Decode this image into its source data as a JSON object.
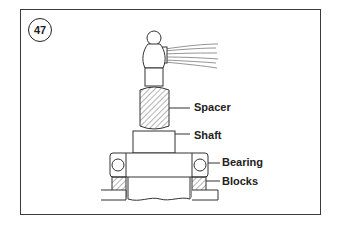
{
  "figure": {
    "number": "47",
    "labels": {
      "spacer": "Spacer",
      "shaft": "Shaft",
      "bearing": "Bearing",
      "blocks": "Blocks"
    }
  },
  "colors": {
    "line": "#333333",
    "background": "#ffffff"
  }
}
